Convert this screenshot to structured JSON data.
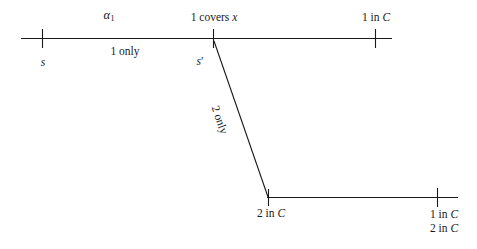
{
  "diagram": {
    "type": "timeline-branch-diagram",
    "stroke_color": "#1a1a1a",
    "background_color": "#ffffff",
    "top_track": {
      "name": "top-timeline",
      "above_labels": {
        "alpha": "α",
        "alpha_subscript": "1",
        "covers": "1 covers ",
        "covers_var": "x",
        "one_in_c": "1 in ",
        "one_in_c_var": "C"
      },
      "below_labels": {
        "start_point": "s",
        "start_prime_point": "s",
        "start_prime_mark": "′",
        "segment": "1 only"
      }
    },
    "branch": {
      "name": "diagonal-branch",
      "label": "2 only"
    },
    "bottom_track": {
      "name": "bottom-timeline",
      "left_label": "2 in ",
      "left_label_var": "C",
      "right_label_top": "1 in ",
      "right_label_top_var": "C",
      "right_label_bottom": "2 in ",
      "right_label_bottom_var": "C"
    }
  }
}
